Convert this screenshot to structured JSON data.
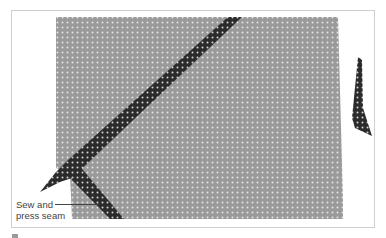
{
  "figure": {
    "annotation": {
      "line1": "Sew and",
      "line2": "press seam"
    },
    "colors": {
      "fabric": "#9a9a9a",
      "fabric_dot": "#e6e6e6",
      "strip": "#2b2b2b",
      "strip_dot": "#d9d9d9",
      "frame_border": "#cfcfcf",
      "label_text": "#444444"
    }
  }
}
